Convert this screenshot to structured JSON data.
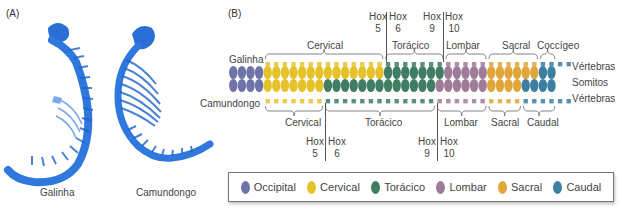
{
  "panel_a": {
    "label": "(A)",
    "specimens": [
      {
        "name": "Galinha"
      },
      {
        "name": "Camundongo"
      }
    ]
  },
  "panel_b": {
    "label": "(B)",
    "row_labels": {
      "chicken": "Galinha",
      "mouse": "Camundongo",
      "vertebrae_top": "Vértebras",
      "somites": "Somitos",
      "vertebrae_bottom": "Vértebras"
    },
    "colors": {
      "occipital": "#6e74a8",
      "cervical": "#e6c22a",
      "thoracic": "#3f7e62",
      "lumbar": "#a07b98",
      "sacral": "#e2a53a",
      "caudal": "#3d7fa0"
    },
    "chicken": {
      "segments": [
        {
          "region": "occipital",
          "count": 4,
          "label": ""
        },
        {
          "region": "cervical",
          "count": 14,
          "label": "Cervical"
        },
        {
          "region": "thoracic",
          "count": 7,
          "label": "Torácico"
        },
        {
          "region": "lumbar",
          "count": 5,
          "label": "Lombar"
        },
        {
          "region": "sacral",
          "count": 6,
          "label": "Sacral"
        },
        {
          "region": "caudal",
          "count": 2,
          "label": "Coccígeo"
        }
      ],
      "hox_boundaries": [
        {
          "left": "Hox 5",
          "right": "Hox 6",
          "left_label": "Hox",
          "left_num": "5",
          "right_label": "Hox",
          "right_num": "6"
        },
        {
          "left": "Hox 9",
          "right": "Hox 10",
          "left_label": "Hox",
          "left_num": "9",
          "right_label": "Hox",
          "right_num": "10"
        }
      ]
    },
    "mouse": {
      "segments": [
        {
          "region": "occipital",
          "count": 4,
          "label": ""
        },
        {
          "region": "cervical",
          "count": 7,
          "label": "Cervical"
        },
        {
          "region": "thoracic",
          "count": 13,
          "label": "Torácico"
        },
        {
          "region": "lumbar",
          "count": 6,
          "label": "Lombar"
        },
        {
          "region": "sacral",
          "count": 4,
          "label": "Sacral"
        },
        {
          "region": "caudal",
          "count": 4,
          "label": "Caudal"
        }
      ],
      "hox_boundaries": [
        {
          "left_label": "Hox",
          "left_num": "5",
          "right_label": "Hox",
          "right_num": "6"
        },
        {
          "left_label": "Hox",
          "left_num": "9",
          "right_label": "Hox",
          "right_num": "10"
        }
      ]
    },
    "legend": [
      {
        "label": "Occipital",
        "color": "#6e74a8"
      },
      {
        "label": "Cervical",
        "color": "#e6c22a"
      },
      {
        "label": "Torácico",
        "color": "#3f7e62"
      },
      {
        "label": "Lombar",
        "color": "#a07b98"
      },
      {
        "label": "Sacral",
        "color": "#e2a53a"
      },
      {
        "label": "Caudal",
        "color": "#3d7fa0"
      }
    ]
  }
}
